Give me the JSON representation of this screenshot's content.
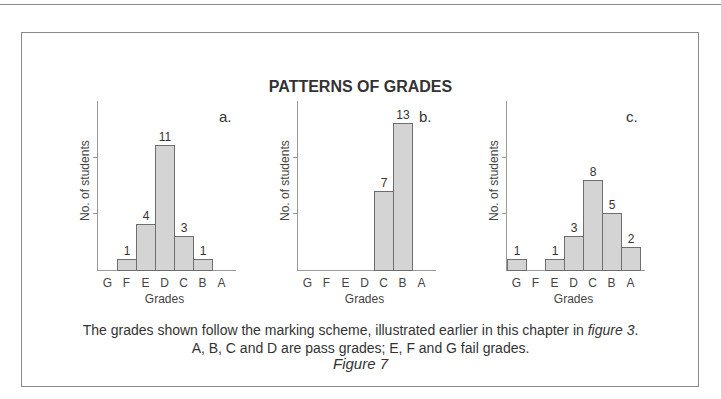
{
  "title": "PATTERNS OF GRADES",
  "caption": {
    "line1_prefix": "The grades shown follow the marking scheme, illustrated earlier in this chapter in ",
    "line1_italic": "figure 3",
    "line1_suffix": ".",
    "line2": "A, B, C and D are pass grades; E, F and G fail grades."
  },
  "figure_label": "Figure 7",
  "chart_data": [
    {
      "type": "bar",
      "panel": "a.",
      "categories": [
        "G",
        "F",
        "E",
        "D",
        "C",
        "B",
        "A"
      ],
      "values": [
        0,
        1,
        4,
        11,
        3,
        1,
        0
      ],
      "xlabel": "Grades",
      "ylabel": "No. of students",
      "grid": false
    },
    {
      "type": "bar",
      "panel": "b.",
      "categories": [
        "G",
        "F",
        "E",
        "D",
        "C",
        "B",
        "A"
      ],
      "values": [
        0,
        0,
        0,
        0,
        7,
        13,
        0
      ],
      "xlabel": "Grades",
      "ylabel": "No. of students",
      "grid": false
    },
    {
      "type": "bar",
      "panel": "c.",
      "categories": [
        "G",
        "F",
        "E",
        "D",
        "C",
        "B",
        "A"
      ],
      "values": [
        1,
        0,
        1,
        3,
        8,
        5,
        2
      ],
      "xlabel": "Grades",
      "ylabel": "No. of students",
      "grid": false
    }
  ],
  "colors": {
    "bar_fill": "#d4d4d4",
    "bar_stroke": "#6e6e6e",
    "axis": "#9a9a9a",
    "text": "#333333"
  }
}
